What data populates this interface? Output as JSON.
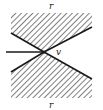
{
  "diagram": {
    "labels": {
      "top_region": "r",
      "bottom_region": "r",
      "vertex": "v"
    },
    "colors": {
      "line": "#1a1a1a",
      "hatch": "#3a3a3a",
      "background": "#ffffff"
    }
  }
}
